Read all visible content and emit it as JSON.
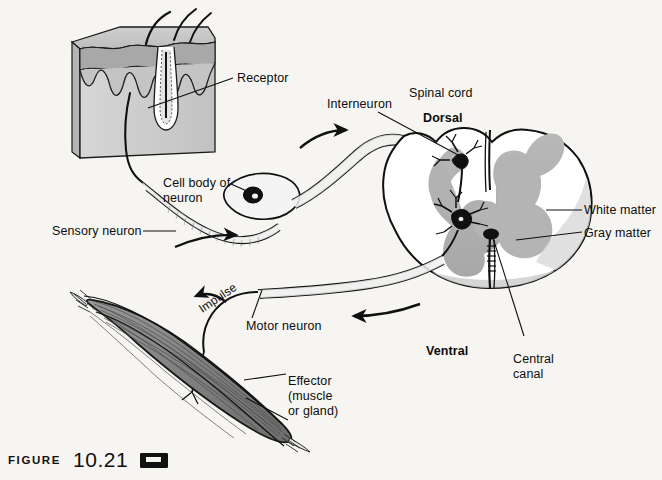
{
  "figure": {
    "caption_word": "Figure",
    "caption_number": "10.21",
    "caption_icon": "media-cassette-icon",
    "background_color": "#f6f5f1",
    "ink_color": "#101010",
    "gray_matter_color": "#b0b0b0",
    "white_matter_color": "#ffffff",
    "muscle_color": "#8d8d8d",
    "skin_color": "#c9c9c9"
  },
  "labels": {
    "receptor": "Receptor",
    "interneuron": "Interneuron",
    "spinal_cord": "Spinal cord",
    "dorsal": "Dorsal",
    "white_matter": "White matter",
    "gray_matter": "Gray matter",
    "cell_body_line1": "Cell body of",
    "cell_body_line2": "neuron",
    "sensory_neuron": "Sensory neuron",
    "impulse": "Impulse",
    "motor_neuron": "Motor neuron",
    "ventral": "Ventral",
    "central_canal_line1": "Central",
    "central_canal_line2": "canal",
    "effector_line1": "Effector",
    "effector_line2": "(muscle",
    "effector_line3": "or gland)"
  }
}
